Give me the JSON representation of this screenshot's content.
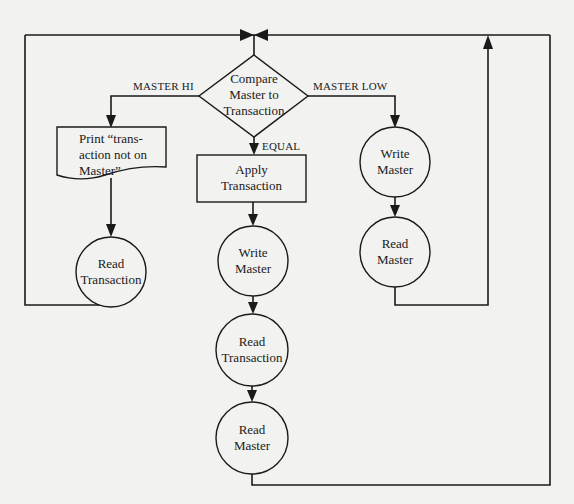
{
  "flowchart": {
    "decision": {
      "line1": "Compare",
      "line2": "Master to",
      "line3": "Transaction"
    },
    "branches": {
      "master_hi": "MASTER HI",
      "master_low": "MASTER LOW",
      "equal": "EQUAL"
    },
    "left": {
      "print_doc": {
        "line1": "Print “trans-",
        "line2": "action not on",
        "line3": "Master”"
      },
      "read_transaction": {
        "line1": "Read",
        "line2": "Transaction"
      }
    },
    "middle": {
      "apply_transaction": {
        "line1": "Apply",
        "line2": "Transaction"
      },
      "write_master": {
        "line1": "Write",
        "line2": "Master"
      },
      "read_transaction": {
        "line1": "Read",
        "line2": "Transaction"
      },
      "read_master": {
        "line1": "Read",
        "line2": "Master"
      }
    },
    "right": {
      "write_master": {
        "line1": "Write",
        "line2": "Master"
      },
      "read_master": {
        "line1": "Read",
        "line2": "Master"
      }
    }
  }
}
